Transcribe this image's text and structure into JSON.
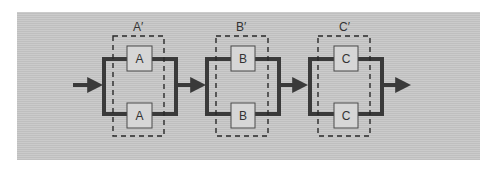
{
  "diagram": {
    "type": "reliability-block-diagram",
    "colors": {
      "background": "#c5c5c5",
      "line": "#3a3a3a",
      "box_fill": "#d6d6d6",
      "box_stroke": "#4a4a4a",
      "dash": "#2a2a2a"
    },
    "stages": [
      {
        "group_label": "A′",
        "top_component": "A",
        "bottom_component": "A",
        "x": 102
      },
      {
        "group_label": "B′",
        "top_component": "B",
        "bottom_component": "B",
        "x": 205
      },
      {
        "group_label": "C′",
        "top_component": "C",
        "bottom_component": "C",
        "x": 308
      }
    ]
  }
}
